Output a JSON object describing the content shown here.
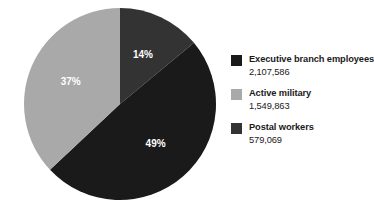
{
  "chart_data": {
    "type": "pie",
    "title": "",
    "subtitle": "",
    "xlabel": "",
    "ylabel": "",
    "legend_position": "right",
    "grid": false,
    "categories": [
      "Executive branch employees",
      "Active military",
      "Postal workers"
    ],
    "values": [
      2107586,
      1549863,
      579069
    ],
    "value_labels": [
      "2,107,586",
      "1,549,863",
      "579,069"
    ],
    "percentages": [
      49,
      37,
      14
    ],
    "percentage_labels": [
      "49%",
      "37%",
      "14%"
    ],
    "colors": [
      "#1a1a1a",
      "#a9a9a9",
      "#333333"
    ],
    "slices": [
      {
        "name": "Postal workers",
        "percent": 14,
        "percent_label": "14%",
        "value": 579069,
        "value_label": "579,069",
        "color": "#333333",
        "start_angle_deg": 0,
        "end_angle_deg": 50.4,
        "label_x": 141,
        "label_y": 48
      },
      {
        "name": "Executive branch employees",
        "percent": 49,
        "percent_label": "49%",
        "value": 2107586,
        "value_label": "2,107,586",
        "color": "#1a1a1a",
        "start_angle_deg": 50.4,
        "end_angle_deg": 226.8,
        "label_x": 143,
        "label_y": 132
      },
      {
        "name": "Active military",
        "percent": 37,
        "percent_label": "37%",
        "value": 1549863,
        "value_label": "1,549,863",
        "color": "#a9a9a9",
        "start_angle_deg": 226.8,
        "end_angle_deg": 360,
        "label_x": 65,
        "label_y": 89
      }
    ],
    "geometry": {
      "center_x": 98,
      "center_y": 99,
      "radius": 96
    }
  },
  "legend": {
    "items": [
      {
        "label": "Executive branch employees",
        "value": "2,107,586",
        "color": "#1a1a1a"
      },
      {
        "label": "Active military",
        "value": "1,549,863",
        "color": "#a9a9a9"
      },
      {
        "label": "Postal workers",
        "value": "579,069",
        "color": "#333333"
      }
    ]
  },
  "colors": {
    "background": "#ffffff",
    "text": "#1a1a1a",
    "slice_label": "#ffffff",
    "dark": "#1a1a1a",
    "mid_dark": "#333333",
    "light_gray": "#a9a9a9"
  }
}
